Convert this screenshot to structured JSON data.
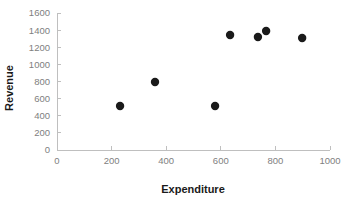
{
  "chart_data": {
    "type": "scatter",
    "title": "",
    "xlabel": "Expenditure",
    "ylabel": "Revenue",
    "xlim": [
      0,
      1000
    ],
    "ylim": [
      0,
      1600
    ],
    "xticks": [
      0,
      200,
      400,
      600,
      800,
      1000
    ],
    "yticks": [
      0,
      200,
      400,
      600,
      800,
      1000,
      1200,
      1400,
      1600
    ],
    "xtick_labels": [
      "0",
      "200",
      "400",
      "600",
      "800",
      "1000"
    ],
    "ytick_labels": [
      "0",
      "200",
      "400",
      "600",
      "800",
      "1000",
      "1200",
      "1400",
      "1600"
    ],
    "grid": false,
    "legend": null,
    "marker_color": "#1a1a1a",
    "marker_shape": "circle",
    "series": [
      {
        "name": "Revenue vs Expenditure",
        "points": [
          {
            "x": 231,
            "y": 514
          },
          {
            "x": 359,
            "y": 794
          },
          {
            "x": 579,
            "y": 514
          },
          {
            "x": 634,
            "y": 1343
          },
          {
            "x": 736,
            "y": 1320
          },
          {
            "x": 766,
            "y": 1390
          },
          {
            "x": 898,
            "y": 1308
          }
        ]
      }
    ]
  },
  "axes": {
    "x_title": "Expenditure",
    "y_title": "Revenue",
    "axis_color": "#bfbfbf",
    "tick_text_color": "#808080",
    "title_color": "#1a1a1a"
  }
}
